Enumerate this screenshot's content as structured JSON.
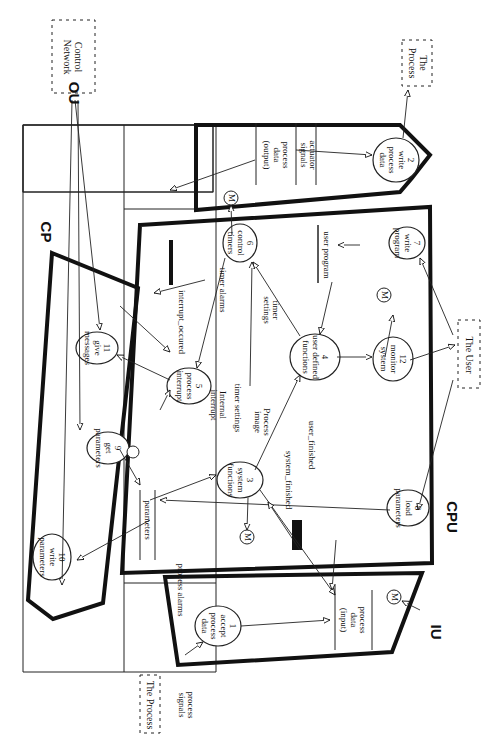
{
  "diagram": {
    "orientation": "rotated 90 degrees clockwise",
    "regions": [
      {
        "id": "CP",
        "label": "CP"
      },
      {
        "id": "OU",
        "label": "OU"
      },
      {
        "id": "CPU",
        "label": "CPU"
      },
      {
        "id": "IU",
        "label": "IU"
      }
    ],
    "externals": [
      {
        "id": "control_network",
        "label": "Control\nNetwork"
      },
      {
        "id": "the_process_out",
        "label": "The\nProcess"
      },
      {
        "id": "the_user",
        "label": "The User"
      },
      {
        "id": "the_process_in",
        "label": "The Process"
      }
    ],
    "processes": [
      {
        "id": "p1",
        "label": "1\naccept\nprocess\ndata"
      },
      {
        "id": "p2",
        "label": "2\nwrite\nprocess\ndata"
      },
      {
        "id": "p3",
        "label": "3\nsystem\nfunctions"
      },
      {
        "id": "p4",
        "label": "4\nuser defined\nfunctions"
      },
      {
        "id": "p5",
        "label": "5\nprocess\ninterrupt"
      },
      {
        "id": "p6",
        "label": "6\ncontrol\ntimers"
      },
      {
        "id": "p7",
        "label": "7\nwrite\nprogram"
      },
      {
        "id": "p8",
        "label": "8\nload\nparameters"
      },
      {
        "id": "p9",
        "label": "9\nget\nparameters"
      },
      {
        "id": "p10",
        "label": "10\nwrite\nparameters"
      },
      {
        "id": "p11",
        "label": "11\ngive\nmessages"
      },
      {
        "id": "p12",
        "label": "12\nmonitor\nsystem"
      }
    ],
    "stores": [
      {
        "id": "s_output",
        "label": "process\ndata\n(output)"
      },
      {
        "id": "s_actuator",
        "label": "actuator\nsignals"
      },
      {
        "id": "s_user_program",
        "label": "user program"
      },
      {
        "id": "s_parameters",
        "label": "parameters"
      },
      {
        "id": "s_input",
        "label": "process\ndata\n(input)"
      }
    ],
    "monitor_marker": "M",
    "flows": {
      "interrupt_occured": "interrupt_occured",
      "timer_alarms": "timer alarms",
      "timer_settings_a": "timer\nsettings",
      "timer_settings_b": "timer settings",
      "internal_interrupt": "Internal\ninterrupt",
      "process_image": "Process\nimage",
      "user_finished": "user_finished",
      "system_finished": "system_finished",
      "process_alarms": "process alarms",
      "process_signals": "process\nsignals"
    }
  }
}
